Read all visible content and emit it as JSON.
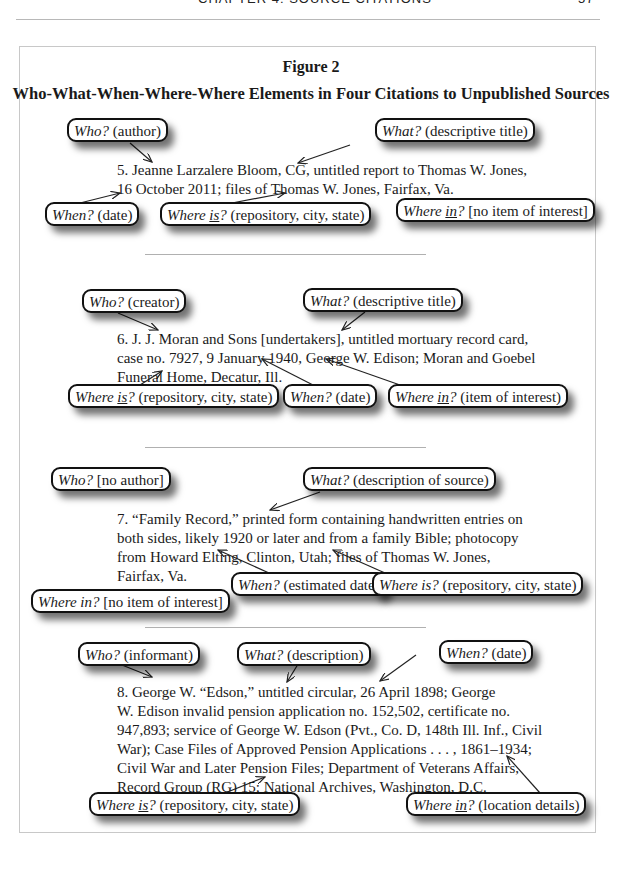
{
  "running_head": {
    "title": "CHAPTER 4: SOURCE CITATIONS",
    "page_number": "57"
  },
  "figure": {
    "label": "Figure 2",
    "title": "Who-What-When-Where-Where Elements in Four Citations to Unpublished Sources"
  },
  "citations": [
    {
      "number": "5",
      "text_before_sc": "5. Jeanne Larzalere Bloom, ",
      "small_caps": "CG",
      "text_after_sc": ", untitled report to Thomas W. Jones,\n16 October 2011; files of Thomas W. Jones, Fairfax, Va.",
      "callouts": [
        {
          "q": "Who?",
          "rest": " (author)"
        },
        {
          "q": "What?",
          "rest": " (descriptive title)"
        },
        {
          "q": "When?",
          "rest": " (date)"
        },
        {
          "q1": "Where ",
          "qu": "is",
          "q2": "?",
          "rest": " (repository, city, state)"
        },
        {
          "q1": "Where ",
          "qu": "in",
          "q2": "?",
          "rest": " [no item of interest]"
        }
      ]
    },
    {
      "number": "6",
      "text": "6. J. J. Moran and Sons [undertakers], untitled mortuary record card,\ncase no. 7927, 9 January 1940, George W. Edison; Moran and Goebel\nFuneral Home, Decatur, Ill.",
      "callouts": [
        {
          "q": "Who?",
          "rest": " (creator)"
        },
        {
          "q": "What?",
          "rest": " (descriptive title)"
        },
        {
          "q1": "Where ",
          "qu": "is",
          "q2": "?",
          "rest": " (repository, city, state)"
        },
        {
          "q": "When?",
          "rest": " (date)"
        },
        {
          "q1": "Where ",
          "qu": "in",
          "q2": "?",
          "rest": " (item of interest)"
        }
      ]
    },
    {
      "number": "7",
      "text": "7. “Family Record,” printed form containing handwritten entries on\nboth sides, likely 1920 or later and from a family Bible; photocopy\nfrom Howard Elting, Clinton, Utah; files of Thomas W. Jones,\nFairfax, Va.",
      "callouts": [
        {
          "q": "Who?",
          "rest": " [no author]"
        },
        {
          "q": "What?",
          "rest": " (description of source)"
        },
        {
          "q": "When?",
          "rest": " (estimated date)"
        },
        {
          "q": "Where is?",
          "rest": " (repository, city, state)"
        },
        {
          "q": "Where in?",
          "rest": " [no item of interest]"
        }
      ]
    },
    {
      "number": "8",
      "text": "8. George W. “Edson,” untitled circular, 26 April 1898; George\nW. Edison invalid pension application no. 152,502, certificate no.\n947,893; service of George W. Edson (Pvt., Co. D, 148th Ill. Inf., Civil\nWar); Case Files of Approved Pension Applications . . . , 1861–1934;\nCivil War and Later Pension Files; Department of Veterans Affairs,\nRecord Group (RG) 15; National Archives, Washington, D.C.",
      "callouts": [
        {
          "q": "Who?",
          "rest": " (informant)"
        },
        {
          "q": "What?",
          "rest": " (description)"
        },
        {
          "q": "When?",
          "rest": " (date)"
        },
        {
          "q1": "Where ",
          "qu": "is",
          "q2": "?",
          "rest": " (repository, city, state)"
        },
        {
          "q1": "Where ",
          "qu": "in",
          "q2": "?",
          "rest": " (location details)"
        }
      ]
    }
  ]
}
